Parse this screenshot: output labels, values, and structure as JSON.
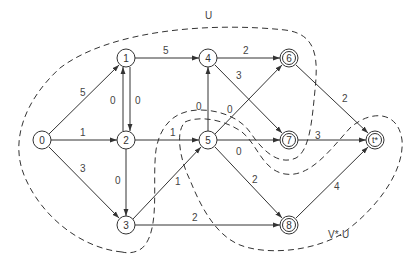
{
  "diagram": {
    "type": "directed-graph",
    "regions": [
      {
        "id": "U",
        "label": "U"
      },
      {
        "id": "V*-U",
        "label": "V*-U"
      }
    ],
    "nodes": [
      {
        "id": "0",
        "label": "0",
        "x": 42,
        "y": 140,
        "double": false
      },
      {
        "id": "1",
        "label": "1",
        "x": 126,
        "y": 58,
        "double": false
      },
      {
        "id": "2",
        "label": "2",
        "x": 126,
        "y": 140,
        "double": false
      },
      {
        "id": "3",
        "label": "3",
        "x": 126,
        "y": 225,
        "double": false
      },
      {
        "id": "4",
        "label": "4",
        "x": 208,
        "y": 58,
        "double": false
      },
      {
        "id": "5",
        "label": "5",
        "x": 208,
        "y": 140,
        "double": false
      },
      {
        "id": "6",
        "label": "6",
        "x": 289,
        "y": 58,
        "double": true
      },
      {
        "id": "7",
        "label": "7",
        "x": 289,
        "y": 140,
        "double": true
      },
      {
        "id": "8",
        "label": "8",
        "x": 289,
        "y": 225,
        "double": true
      },
      {
        "id": "t",
        "label": "t*",
        "x": 375,
        "y": 140,
        "double": true
      }
    ],
    "edges": [
      {
        "from": "0",
        "to": "1",
        "weight": "5"
      },
      {
        "from": "0",
        "to": "2",
        "weight": "1"
      },
      {
        "from": "0",
        "to": "3",
        "weight": "3"
      },
      {
        "from": "2",
        "to": "1",
        "weight": "0"
      },
      {
        "from": "1",
        "to": "2",
        "weight": "0"
      },
      {
        "from": "1",
        "to": "4",
        "weight": "5"
      },
      {
        "from": "2",
        "to": "3",
        "weight": "0"
      },
      {
        "from": "2",
        "to": "5",
        "weight": "1"
      },
      {
        "from": "3",
        "to": "5",
        "weight": "1"
      },
      {
        "from": "3",
        "to": "8",
        "weight": "2"
      },
      {
        "from": "5",
        "to": "4",
        "weight": "0"
      },
      {
        "from": "4",
        "to": "6",
        "weight": "2"
      },
      {
        "from": "4",
        "to": "7",
        "weight": "3"
      },
      {
        "from": "5",
        "to": "6",
        "weight": "0"
      },
      {
        "from": "5",
        "to": "7",
        "weight": "0"
      },
      {
        "from": "5",
        "to": "8",
        "weight": "2"
      },
      {
        "from": "6",
        "to": "t",
        "weight": "2"
      },
      {
        "from": "7",
        "to": "t",
        "weight": "3"
      },
      {
        "from": "8",
        "to": "t",
        "weight": "4"
      }
    ]
  },
  "labels": {
    "region_u": "U",
    "region_v": "V*-U",
    "n0": "0",
    "n1": "1",
    "n2": "2",
    "n3": "3",
    "n4": "4",
    "n5": "5",
    "n6": "6",
    "n7": "7",
    "n8": "8",
    "nt": "t*",
    "e01": "5",
    "e02": "1",
    "e03": "3",
    "e21": "0",
    "e12": "0",
    "e14": "5",
    "e23": "0",
    "e25": "1",
    "e35": "1",
    "e38": "2",
    "e54": "0",
    "e46": "2",
    "e47": "3",
    "e56": "0",
    "e57": "0",
    "e58": "2",
    "e6t": "2",
    "e7t": "3",
    "e8t": "4"
  }
}
